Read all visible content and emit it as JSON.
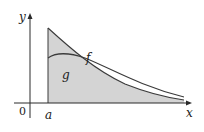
{
  "figure": {
    "labels": {
      "y_axis": "y",
      "x_axis": "x",
      "origin": "0",
      "a": "a",
      "f": "f",
      "g": "g"
    },
    "colors": {
      "region_fill": "#d4d4d4",
      "curve_stroke": "#3a3a3a",
      "axis_stroke": "#2a2a2a",
      "background": "#ffffff"
    }
  }
}
